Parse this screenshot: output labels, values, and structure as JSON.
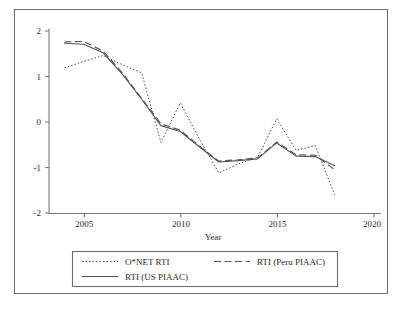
{
  "chart_data": {
    "type": "line",
    "title": "",
    "xlabel": "Year",
    "ylabel": "",
    "xlim": [
      2003.2,
      2020.4
    ],
    "ylim": [
      -2.25,
      2.25
    ],
    "xticks": [
      2005,
      2010,
      2015,
      2020
    ],
    "xtick_labels": [
      "2005",
      "2010",
      "2015",
      "2020"
    ],
    "yticks": [
      -2,
      -1,
      0,
      1,
      2
    ],
    "ytick_labels": [
      "-2",
      "-1",
      "0",
      "1",
      "2"
    ],
    "grid": false,
    "legend_position": "below-axes",
    "x": [
      2004,
      2005,
      2006,
      2007,
      2008,
      2009,
      2010,
      2011,
      2012,
      2013,
      2014,
      2015,
      2016,
      2017,
      2018
    ],
    "series": [
      {
        "name": "O*NET RTI",
        "style": "dotted",
        "values": [
          1.19,
          1.33,
          1.46,
          1.26,
          1.08,
          -0.45,
          0.42,
          -0.38,
          -1.12,
          -0.92,
          -0.78,
          0.07,
          -0.62,
          -0.52,
          -1.6
        ]
      },
      {
        "name": "RTI (Peru PIAAC)",
        "style": "dashed",
        "values": [
          1.76,
          1.77,
          1.56,
          1.08,
          0.52,
          -0.04,
          -0.18,
          -0.53,
          -0.86,
          -0.83,
          -0.79,
          -0.44,
          -0.72,
          -0.73,
          -1.05
        ]
      },
      {
        "name": "RTI (US PIAAC)",
        "style": "solid",
        "values": [
          1.73,
          1.71,
          1.52,
          1.05,
          0.5,
          -0.08,
          -0.21,
          -0.55,
          -0.88,
          -0.85,
          -0.81,
          -0.46,
          -0.75,
          -0.76,
          -0.96
        ]
      }
    ]
  },
  "legend": {
    "entries": [
      {
        "label": "O*NET RTI",
        "style": "dotted"
      },
      {
        "label": "RTI (Peru PIAAC)",
        "style": "dashed"
      },
      {
        "label": "RTI (US PIAAC)",
        "style": "solid"
      }
    ]
  },
  "colors": {
    "line": "#55555c",
    "axis": "#7a7a80",
    "border": "#6d6d72",
    "text": "#2b2b2b",
    "background": "#ffffff"
  }
}
